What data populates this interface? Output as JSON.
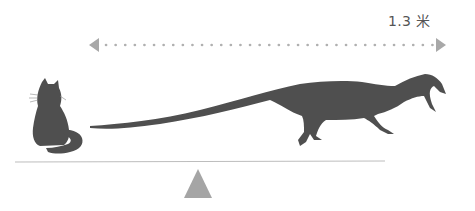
{
  "scale_label": "1.3 米",
  "colors": {
    "silhouette": "#4f4f4f",
    "arrow": "#a8a8a8",
    "dots": "#b0b0b0",
    "fulcrum": "#a5a5a5",
    "beam": "#bdbdbd"
  },
  "figures": [
    {
      "name": "cat",
      "role": "size reference"
    },
    {
      "name": "dinosaur",
      "role": "subject",
      "length": "1.3 米"
    }
  ],
  "elements": {
    "length_arrow": "dotted double-headed arrow",
    "seesaw_beam": "horizontal line",
    "fulcrum": "triangle"
  }
}
